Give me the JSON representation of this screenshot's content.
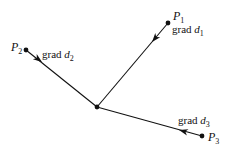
{
  "diagram": {
    "type": "gradient-vectors",
    "stroke_color": "#111111",
    "background": "#ffffff",
    "center": {
      "x": 97,
      "y": 107
    },
    "points": [
      {
        "id": "P1",
        "label": "P",
        "subscript": "1",
        "x": 168,
        "y": 23,
        "grad_word": "grad",
        "grad_var": "d",
        "grad_sub": "1",
        "label_pos": {
          "x": 173,
          "y": 20
        },
        "grad_pos": {
          "x": 172,
          "y": 33
        },
        "arrow_tip": {
          "x": 152,
          "y": 42
        }
      },
      {
        "id": "P2",
        "label": "P",
        "subscript": "2",
        "x": 26,
        "y": 50,
        "grad_word": "grad",
        "grad_var": "d",
        "grad_sub": "2",
        "label_pos": {
          "x": 11,
          "y": 51
        },
        "grad_pos": {
          "x": 42,
          "y": 58
        },
        "arrow_tip": {
          "x": 42,
          "y": 62
        }
      },
      {
        "id": "P3",
        "label": "P",
        "subscript": "3",
        "x": 202,
        "y": 136,
        "grad_word": "grad",
        "grad_var": "d",
        "grad_sub": "3",
        "label_pos": {
          "x": 208,
          "y": 141
        },
        "grad_pos": {
          "x": 178,
          "y": 124
        },
        "arrow_tip": {
          "x": 179,
          "y": 130
        }
      }
    ]
  }
}
